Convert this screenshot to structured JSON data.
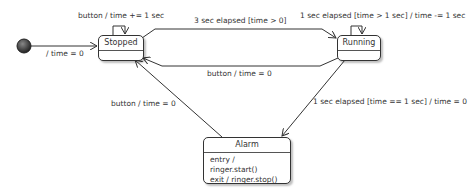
{
  "diagram": {
    "type": "state-machine",
    "initial": {
      "label": "/ time = 0"
    },
    "states": [
      {
        "id": "stopped",
        "name": "Stopped",
        "actions": []
      },
      {
        "id": "running",
        "name": "Running",
        "actions": []
      },
      {
        "id": "alarm",
        "name": "Alarm",
        "actions": [
          "entry / ringer.start()",
          "exit / ringer.stop()"
        ]
      }
    ],
    "transitions": [
      {
        "from": "initial",
        "to": "stopped",
        "label": "/ time = 0"
      },
      {
        "from": "stopped",
        "to": "stopped",
        "label": "button / time += 1 sec"
      },
      {
        "from": "stopped",
        "to": "running",
        "label": "3 sec elapsed [time > 0]"
      },
      {
        "from": "running",
        "to": "running",
        "label": "1 sec elapsed [time > 1 sec] / time -= 1 sec"
      },
      {
        "from": "running",
        "to": "stopped",
        "label": "button / time = 0"
      },
      {
        "from": "running",
        "to": "alarm",
        "label": "1 sec elapsed [time == 1 sec] / time = 0"
      },
      {
        "from": "alarm",
        "to": "stopped",
        "label": "button / time = 0"
      }
    ]
  }
}
